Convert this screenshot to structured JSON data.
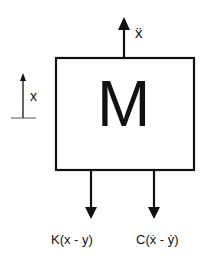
{
  "diagram": {
    "mass_label": "M",
    "acceleration_label": "ẍ",
    "displacement_label": "x",
    "spring_force_label": "K(x - y)",
    "damper_force_label": "C(ẋ - ẏ)",
    "stroke_color": "#111111"
  }
}
